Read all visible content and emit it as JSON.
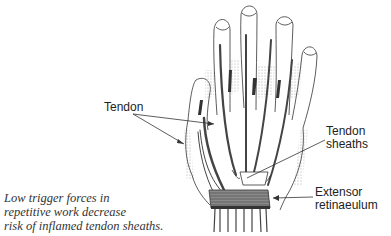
{
  "diagram": {
    "labels": {
      "tendon": "Tendon",
      "tendon_sheaths_line1": "Tendon",
      "tendon_sheaths_line2": "sheaths",
      "extensor_line1": "Extensor",
      "extensor_line2": "retinaeulum"
    },
    "caption": {
      "line1": "Low trigger forces in",
      "line2": "repetitive work decrease",
      "line3": "risk of inflamed tendon sheaths."
    },
    "colors": {
      "outline": "#333333",
      "tendon": "#444444",
      "retinaculum": "#555555",
      "background": "#ffffff"
    }
  }
}
